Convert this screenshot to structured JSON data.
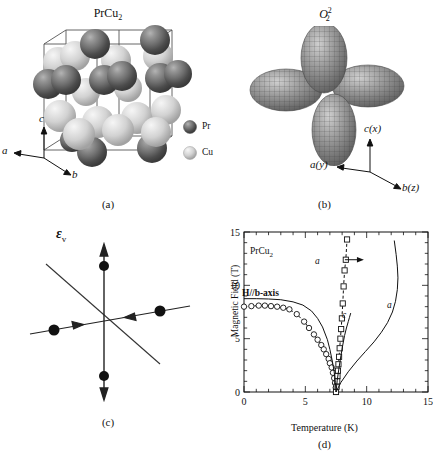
{
  "figure": {
    "panels": [
      {
        "id": "a",
        "caption": "(a)",
        "title": "PrCu2",
        "title_base": "PrCu",
        "title_sub": "2"
      },
      {
        "id": "b",
        "caption": "(b)",
        "title_base": "O",
        "title_sup": "2",
        "title_sub": "2"
      },
      {
        "id": "c",
        "caption": "(c)",
        "title_base": "ε",
        "title_sub": "v"
      },
      {
        "id": "d",
        "caption": "(d)"
      }
    ]
  },
  "panel_a": {
    "title_base": "PrCu",
    "title_sub": "2",
    "caption": "(a)",
    "legend": [
      {
        "label": "Pr",
        "kind": "pr-sphere"
      },
      {
        "label": "Cu",
        "kind": "cu-sphere"
      }
    ],
    "axes": [
      {
        "label": "c",
        "dir": "up"
      },
      {
        "label": "a",
        "dir": "left"
      },
      {
        "label": "b",
        "dir": "lower-right"
      }
    ]
  },
  "panel_b": {
    "title_base": "O",
    "title_sup": "2",
    "title_sub": "2",
    "caption": "(b)",
    "orbital_lobes": 4,
    "axes": [
      {
        "label": "c(x)",
        "dir": "up"
      },
      {
        "label": "a(y)",
        "dir": "left"
      },
      {
        "label": "b(z)",
        "dir": "lower-right"
      }
    ]
  },
  "panel_c": {
    "title_base": "ε",
    "title_sub": "v",
    "caption": "(c)",
    "arrows": [
      {
        "dir": "up",
        "kind": "outward"
      },
      {
        "dir": "down",
        "kind": "outward"
      },
      {
        "dir": "left",
        "kind": "inward"
      },
      {
        "dir": "right",
        "kind": "inward"
      }
    ]
  },
  "chart_data": {
    "type": "scatter",
    "title": "",
    "caption": "(d)",
    "xlabel": "Temperature (K)",
    "ylabel": "Magnetic Field (T)",
    "xlim": [
      0,
      15
    ],
    "ylim": [
      0,
      15
    ],
    "xticks": [
      0,
      5,
      10,
      15
    ],
    "yticks": [
      0,
      5,
      10,
      15
    ],
    "xminor_step": 1,
    "yminor_step": 1,
    "grid": false,
    "annotations": [
      {
        "text": "PrCu2",
        "text_base": "PrCu",
        "text_sub": "2",
        "x": 1.6,
        "y": 13.3
      },
      {
        "text": "H//b-axis",
        "x": 1.3,
        "y": 9.6
      },
      {
        "text": "a",
        "x": 7.9,
        "y": 12.4,
        "note": "arrow pointing right to square series"
      },
      {
        "text": "c",
        "x": 9.0,
        "y": 6.6
      },
      {
        "text": "a",
        "x": 12.9,
        "y": 7.6
      }
    ],
    "series": [
      {
        "name": "b-axis transition (open circles)",
        "marker": "open-circle",
        "linestyle": "dashed-then-solid",
        "x": [
          0.0,
          0.6,
          1.2,
          1.7,
          2.2,
          2.7,
          3.2,
          3.7,
          4.3,
          4.9,
          5.3,
          5.7,
          6.0,
          6.3,
          6.5,
          6.7,
          6.9,
          7.0,
          7.15,
          7.25,
          7.35,
          7.42,
          7.48,
          7.5
        ],
        "y": [
          8.0,
          8.05,
          8.1,
          8.1,
          8.05,
          8.0,
          7.9,
          7.75,
          7.3,
          6.6,
          6.0,
          5.4,
          4.9,
          4.4,
          4.0,
          3.55,
          3.1,
          2.7,
          2.3,
          1.8,
          1.3,
          0.85,
          0.4,
          0.0
        ]
      },
      {
        "name": "a-axis transition (open squares)",
        "marker": "open-square",
        "linestyle": "dashed",
        "x": [
          7.5,
          7.55,
          7.6,
          7.62,
          7.66,
          7.7,
          7.75,
          7.8,
          7.86,
          7.92,
          7.98,
          8.05,
          8.12,
          8.2,
          8.3,
          8.4
        ],
        "y": [
          0.0,
          0.5,
          1.0,
          1.5,
          2.0,
          2.6,
          3.3,
          4.1,
          5.0,
          5.9,
          6.9,
          8.3,
          9.9,
          11.4,
          12.4,
          14.3
        ]
      },
      {
        "name": "calculated b-axis curve",
        "marker": "none",
        "linestyle": "solid",
        "x": [
          0.0,
          1.0,
          2.0,
          3.0,
          4.0,
          4.8,
          5.5,
          6.0,
          6.4,
          6.8,
          7.0,
          7.2,
          7.35,
          7.45,
          7.5
        ],
        "y": [
          8.75,
          8.75,
          8.72,
          8.65,
          8.45,
          8.15,
          7.6,
          6.9,
          6.1,
          4.9,
          4.0,
          2.9,
          1.9,
          0.9,
          0.0
        ]
      },
      {
        "name": "calculated c-axis curve",
        "marker": "none",
        "linestyle": "solid",
        "label": "c",
        "x": [
          7.5,
          7.6,
          7.75,
          7.9,
          8.05,
          8.2,
          8.35,
          8.5,
          8.6,
          8.7
        ],
        "y": [
          0.0,
          1.1,
          2.3,
          3.4,
          4.4,
          5.3,
          6.0,
          6.6,
          7.0,
          7.4
        ]
      },
      {
        "name": "calculated a-axis curve",
        "marker": "none",
        "linestyle": "solid",
        "label": "a",
        "x": [
          7.5,
          7.9,
          8.5,
          9.2,
          9.9,
          10.6,
          11.2,
          11.7,
          12.1,
          12.35,
          12.5,
          12.55,
          12.5,
          12.4,
          12.25
        ],
        "y": [
          0.0,
          0.9,
          1.9,
          2.9,
          3.8,
          4.7,
          5.6,
          6.5,
          7.5,
          8.5,
          9.6,
          10.7,
          11.8,
          12.9,
          14.2
        ]
      }
    ]
  }
}
